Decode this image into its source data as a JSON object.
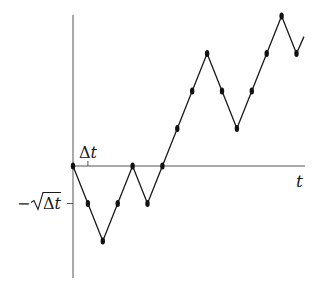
{
  "labels": {
    "x_axis": "t",
    "tick_x": "Δt",
    "tick_y_minus": "−",
    "tick_y_sqrt_body": "Δt"
  },
  "colors": {
    "axis": "#555555",
    "path": "#1a1a1a",
    "dot": "#111111"
  },
  "chart_data": {
    "type": "line",
    "title": "",
    "xlabel": "t",
    "ylabel": "",
    "x_unit": "Δt",
    "y_unit": "√Δt",
    "x": [
      0,
      1,
      2,
      3,
      4,
      5,
      6,
      7,
      8,
      9,
      10,
      11,
      12,
      13,
      14,
      15
    ],
    "values": [
      0,
      -1,
      -2,
      -1,
      0,
      -1,
      0,
      1,
      2,
      3,
      2,
      1,
      2,
      3,
      4,
      3
    ],
    "tail": {
      "x": 15.5,
      "value": 3.45
    },
    "x_ticks": [
      {
        "x": 1,
        "label": "Δt"
      }
    ],
    "y_ticks": [
      {
        "y": -1,
        "label": "−√Δt"
      }
    ],
    "grid": false,
    "legend": null
  },
  "geometry": {
    "origin_x": 73,
    "origin_y": 166,
    "dx": 14.9,
    "dy": 37.5,
    "y_axis_top": 15,
    "y_axis_bottom": 278,
    "x_axis_right": 305
  }
}
